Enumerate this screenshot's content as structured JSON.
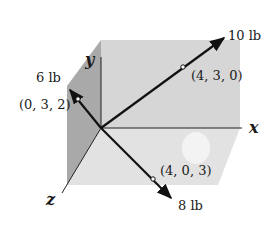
{
  "diagram": {
    "axes": {
      "x": "x",
      "y": "y",
      "z": "z"
    },
    "forces": [
      {
        "magnitude": "10 lb",
        "point": "(4, 3, 0)"
      },
      {
        "magnitude": "6 lb",
        "point": "(0, 3, 2)"
      },
      {
        "magnitude": "8 lb",
        "point": "(4, 0, 3)"
      }
    ],
    "colors": {
      "back_face": "#d6d6d6",
      "left_face": "#a9a9a9",
      "bottom_face": "#e0e0e0",
      "line": "#111111"
    }
  }
}
